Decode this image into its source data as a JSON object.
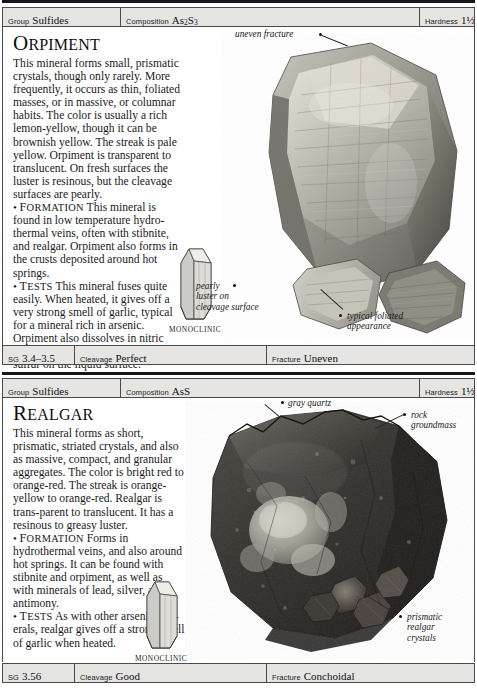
{
  "page": {
    "entries": [
      {
        "id": "orpiment",
        "name": "Orpiment",
        "name_initial": "O",
        "name_rest": "RPIMENT",
        "header": {
          "group_label": "Group",
          "group_value": "Sulfides",
          "composition_label": "Composition",
          "composition_value": "As2S3",
          "composition_prefix": "As",
          "composition_sub1": "2",
          "composition_mid": "S",
          "composition_sub2": "3",
          "hardness_label": "Hardness",
          "hardness_value": "1½–2"
        },
        "footer": {
          "sg_label": "SG",
          "sg_value": "3.4–3.5",
          "cleavage_label": "Cleavage",
          "cleavage_value": "Perfect",
          "fracture_label": "Fracture",
          "fracture_value": "Uneven"
        },
        "intro": "This mineral forms small, prismatic crystals, though only rarely. More frequently, it occurs as thin, foliated masses, or in massive, or columnar habits. The color is usually a rich lemon-yellow, though it can be brownish yellow. The streak is pale yellow. Orpiment is transparent to translucent. On fresh surfaces the luster is resinous, but the cleavage surfaces are pearly.",
        "sections": [
          {
            "heading": "FORMATION",
            "heading_initial": "F",
            "heading_rest": "ORMATION",
            "text": "This mineral is found in low temperature hydro-thermal veins, often with stibnite, and realgar. Orpiment also forms in the crusts deposited around hot springs."
          },
          {
            "heading": "TESTS",
            "heading_initial": "T",
            "heading_rest": "ESTS",
            "text": "This mineral fuses quite easily. When heated, it gives off a very strong smell of garlic, typical for a mineral rich in arsenic. Orpiment also dissolves in nitric acid, leaving behind traces of yellow sulfur on the liquid surface."
          }
        ],
        "crystal_system": "MONOCLINIC",
        "callouts": [
          {
            "name": "uneven-fracture",
            "text": "uneven fracture"
          },
          {
            "name": "pearly-luster",
            "line1": "pearly",
            "line2": "luster on",
            "line3": "cleavage surface"
          },
          {
            "name": "typical-foliated",
            "line1": "typical foliated",
            "line2": "appearance"
          }
        ]
      },
      {
        "id": "realgar",
        "name": "Realgar",
        "name_initial": "R",
        "name_rest": "EALGAR",
        "header": {
          "group_label": "Group",
          "group_value": "Sulfides",
          "composition_label": "Composition",
          "composition_value": "AsS",
          "hardness_label": "Hardness",
          "hardness_value": "1½–2"
        },
        "footer": {
          "sg_label": "SG",
          "sg_value": "3.56",
          "cleavage_label": "Cleavage",
          "cleavage_value": "Good",
          "fracture_label": "Fracture",
          "fracture_value": "Conchoidal"
        },
        "intro": "This mineral forms as short, prismatic, striated crystals, and also as massive, compact, and granular aggregates. The color is bright red to orange-red. The streak is orange-yellow to orange-red. Realgar is trans-parent to translucent. It has a resinous to greasy luster.",
        "sections": [
          {
            "heading": "FORMATION",
            "heading_initial": "F",
            "heading_rest": "ORMATION",
            "text": "Forms in hydrothermal veins, and also around hot springs. It can be found with stibnite and orpiment, as well as with minerals of lead, silver, and antimony."
          },
          {
            "heading": "TESTS",
            "heading_initial": "T",
            "heading_rest": "ESTS",
            "text": "As with other arsenic min-erals, realgar gives off a strong smell of garlic when heated."
          }
        ],
        "crystal_system": "MONOCLINIC",
        "callouts": [
          {
            "name": "gray-quartz",
            "text": "gray quartz"
          },
          {
            "name": "rock-groundmass",
            "line1": "rock",
            "line2": "groundmass"
          },
          {
            "name": "prismatic-crystals",
            "line1": "prismatic",
            "line2": "realgar",
            "line3": "crystals"
          }
        ]
      }
    ]
  }
}
